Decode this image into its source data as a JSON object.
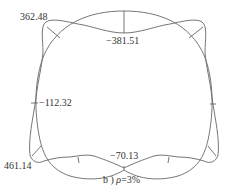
{
  "diagram": {
    "type": "bending-moment-diagram",
    "caption": {
      "prefix": "b )",
      "symbol": "ρ",
      "suffix": "=3%"
    },
    "labels": {
      "crown_value": "−381.51",
      "top_left_value": "362.48",
      "left_wall_value": "−112.32",
      "bottom_left_value": "461.14",
      "invert_value": "−70.13"
    },
    "colors": {
      "line": "#666666",
      "text": "#333333",
      "background": "#ffffff"
    }
  }
}
